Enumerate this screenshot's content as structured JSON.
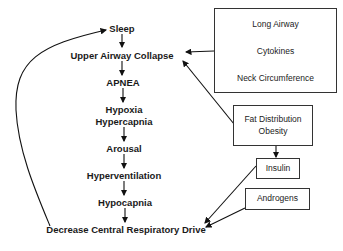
{
  "diagram": {
    "chain": [
      {
        "id": "sleep",
        "label": "Sleep"
      },
      {
        "id": "upper-airway-collapse",
        "label": "Upper Airway Collapse"
      },
      {
        "id": "apnea",
        "label": "APNEA"
      },
      {
        "id": "hypoxia",
        "label": "Hypoxia"
      },
      {
        "id": "hypercapnia",
        "label": "Hypercapnia"
      },
      {
        "id": "arousal",
        "label": "Arousal"
      },
      {
        "id": "hyperventilation",
        "label": "Hyperventilation"
      },
      {
        "id": "hypocapnia",
        "label": "Hypocapnia"
      },
      {
        "id": "decrease-drive",
        "label": "Decrease Central Respiratory Drive"
      }
    ],
    "boxes": {
      "airway_factors": [
        "Long Airway",
        "Cytokines",
        "Neck Circumference"
      ],
      "fat": [
        "Fat Distribution",
        "Obesity"
      ],
      "insulin": "Insulin",
      "androgens": "Androgens"
    },
    "edges": [
      [
        "sleep",
        "upper-airway-collapse"
      ],
      [
        "upper-airway-collapse",
        "apnea"
      ],
      [
        "apnea",
        "hypoxia-hypercapnia"
      ],
      [
        "hypoxia-hypercapnia",
        "arousal"
      ],
      [
        "arousal",
        "hyperventilation"
      ],
      [
        "hyperventilation",
        "hypocapnia"
      ],
      [
        "hypocapnia",
        "decrease-drive"
      ],
      [
        "decrease-drive",
        "sleep"
      ],
      [
        "airway_factors",
        "upper-airway-collapse"
      ],
      [
        "fat",
        "upper-airway-collapse"
      ],
      [
        "fat",
        "insulin"
      ],
      [
        "insulin",
        "decrease-drive"
      ],
      [
        "androgens",
        "decrease-drive"
      ]
    ]
  }
}
